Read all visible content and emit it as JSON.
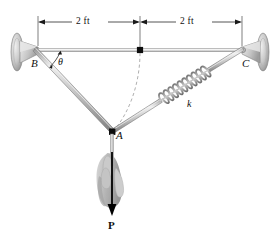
{
  "figure": {
    "width": 279,
    "height": 238,
    "background": "#ffffff"
  },
  "dimensions": {
    "left_span_label": "2 ft",
    "right_span_label": "2 ft",
    "line_color": "#1a1a1a"
  },
  "labels": {
    "support_left": "B",
    "support_right": "C",
    "joint": "A",
    "angle": "θ",
    "spring_stiffness": "k",
    "force": "P"
  },
  "colors": {
    "member": "#b8b8b8",
    "member_edge": "#7d7d7d",
    "member_highlight": "#e8e8e8",
    "spring": "#9a9a9a",
    "spring_dark": "#6e6e6e",
    "support": "#c8c8c8",
    "support_edge": "#8c8c8c",
    "hand": "#b0b0b0",
    "node": "#101010",
    "dashed_arc": "#9c9c9c",
    "arrow": "#000000"
  },
  "geometry": {
    "support_left_point": [
      38,
      50
    ],
    "support_right_point": [
      242,
      50
    ],
    "midpoint": [
      140,
      50
    ],
    "joint_point": [
      112,
      132
    ],
    "dimension_line_y": 22,
    "force_arrow_tip": [
      112,
      215
    ],
    "spring_label_point": [
      189,
      104
    ]
  },
  "annotations": {
    "arc_description": "dashed arc from midpoint to joint A",
    "spring_description": "helical coil spring between joint A and support C",
    "hand_description": "hand gripping cord pulling downward"
  }
}
